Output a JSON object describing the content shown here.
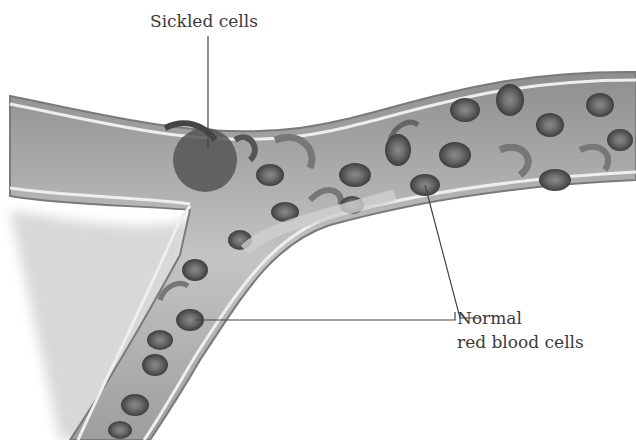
{
  "diagram": {
    "labels": {
      "sickled": "Sickled cells",
      "normal_line1": "Normal",
      "normal_line2": "red blood cells"
    },
    "colors": {
      "vessel_wall": "#9a9a9a",
      "vessel_inner": "#bdbdbd",
      "cell_dark": "#4a4a4a",
      "cell_mid": "#777777",
      "leader_line": "#444444"
    }
  }
}
